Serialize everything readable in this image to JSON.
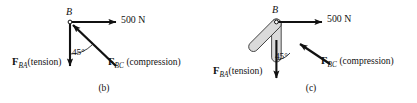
{
  "figure": {
    "background_color": "#ffffff",
    "ink_color": "#111111",
    "member_fill_color": "#d9d9d9",
    "member_stroke_color": "#333333"
  },
  "panels": [
    {
      "id": "b",
      "caption": "(b)",
      "joint_label": "B",
      "applied_load": {
        "label": "500 N",
        "direction": "right"
      },
      "angle": {
        "label": "45°",
        "value": 45,
        "unit": "degrees"
      },
      "forces": [
        {
          "name": "F_BA",
          "symbol": "F",
          "subscript": "BA",
          "state": "(tension)",
          "direction": "down"
        },
        {
          "name": "F_BC",
          "symbol": "F",
          "subscript": "BC",
          "state": "(compression)",
          "direction": "up-left"
        }
      ],
      "shows_members": false
    },
    {
      "id": "c",
      "caption": "(c)",
      "joint_label": "B",
      "applied_load": {
        "label": "500 N",
        "direction": "right"
      },
      "angle": {
        "label": "45°",
        "value": 45,
        "unit": "degrees"
      },
      "forces": [
        {
          "name": "F_BA",
          "symbol": "F",
          "subscript": "BA",
          "state": "(tension)",
          "direction": "down"
        },
        {
          "name": "F_BC",
          "symbol": "F",
          "subscript": "BC",
          "state": "(compression)",
          "direction": "up-left"
        }
      ],
      "shows_members": true
    }
  ]
}
